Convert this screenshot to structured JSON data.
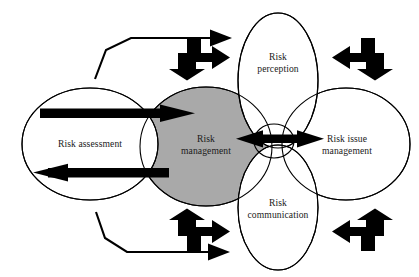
{
  "diagram": {
    "background_color": "#ffffff",
    "outline_color": "#000000",
    "core_fill_color": "#a9a9a9",
    "arrow_color": "#000000",
    "nodes": [
      {
        "id": "risk-assessment",
        "label": "Risk assessment",
        "shape": "ellipse",
        "fill": "#ffffff"
      },
      {
        "id": "risk-management",
        "label": "Risk\nmanagement",
        "shape": "ellipse",
        "fill": "#a9a9a9"
      },
      {
        "id": "risk-perception",
        "label": "Risk\nperception",
        "shape": "ellipse",
        "fill": "#ffffff"
      },
      {
        "id": "risk-communication",
        "label": "Risk\ncommunication",
        "shape": "ellipse",
        "fill": "#ffffff"
      },
      {
        "id": "risk-issue-management",
        "label": "Risk issue\nmanagement",
        "shape": "ellipse",
        "fill": "#ffffff"
      }
    ],
    "connectors": [
      {
        "id": "assessment-to-management",
        "style": "thick",
        "direction": "right"
      },
      {
        "id": "management-to-assessment",
        "style": "thick",
        "direction": "left"
      },
      {
        "id": "management-issue-bidirectional",
        "style": "thick",
        "direction": "double-horizontal"
      },
      {
        "id": "top-left-elbow",
        "style": "thin",
        "direction": "right"
      },
      {
        "id": "bottom-left-elbow",
        "style": "thin",
        "direction": "right"
      },
      {
        "id": "top-left-bent",
        "style": "thick",
        "direction": "right-down"
      },
      {
        "id": "top-right-bent",
        "style": "thick",
        "direction": "left-down"
      },
      {
        "id": "bottom-left-bent",
        "style": "thick",
        "direction": "up-right"
      },
      {
        "id": "bottom-right-bent",
        "style": "thick",
        "direction": "up-left"
      }
    ]
  }
}
